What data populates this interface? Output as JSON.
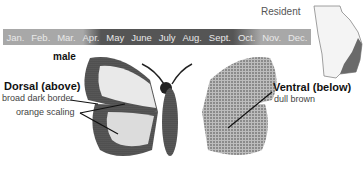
{
  "range": {
    "label": "Resident",
    "region_color": "#6a6a6a"
  },
  "flight_period": {
    "months": [
      "Jan.",
      "Feb.",
      "Mar.",
      "Apr.",
      "May",
      "June",
      "July",
      "Aug.",
      "Sept.",
      "Oct.",
      "Nov.",
      "Dec."
    ],
    "active_from": "Apr.",
    "active_to": "Oct.",
    "bar_color": "#a8a8a8",
    "active_color": "#555555"
  },
  "illustration": {
    "sex": "male",
    "dorsal": {
      "title": "Dorsal (above)",
      "notes": [
        "broad dark border",
        "orange scaling"
      ]
    },
    "ventral": {
      "title": "Ventral (below)",
      "notes": [
        "dull brown"
      ]
    }
  }
}
